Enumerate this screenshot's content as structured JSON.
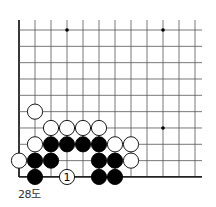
{
  "caption": "28도",
  "board": {
    "origin_x": 19,
    "origin_y": 30,
    "spacing_x": 16,
    "spacing_y": 16.33,
    "cols": 12,
    "rows": 10,
    "right_extend": 202,
    "top_extend": 20,
    "stone_radius": 7.6,
    "edges": [
      "left",
      "bottom"
    ],
    "line_color": "#555555",
    "edge_color": "#222222",
    "black_color": "#000000",
    "white_fill": "#ffffff",
    "star_points": [
      [
        3,
        0
      ],
      [
        9,
        0
      ],
      [
        9,
        6
      ]
    ],
    "stones": [
      {
        "color": "white",
        "col": 1,
        "row": 5
      },
      {
        "color": "white",
        "col": 2,
        "row": 6
      },
      {
        "color": "white",
        "col": 3,
        "row": 6
      },
      {
        "color": "white",
        "col": 4,
        "row": 6
      },
      {
        "color": "white",
        "col": 5,
        "row": 6
      },
      {
        "color": "white",
        "col": 1,
        "row": 7
      },
      {
        "color": "black",
        "col": 2,
        "row": 7
      },
      {
        "color": "black",
        "col": 3,
        "row": 7
      },
      {
        "color": "black",
        "col": 4,
        "row": 7
      },
      {
        "color": "black",
        "col": 5,
        "row": 7
      },
      {
        "color": "white",
        "col": 6,
        "row": 7
      },
      {
        "color": "white",
        "col": 7,
        "row": 7
      },
      {
        "color": "white",
        "col": 0,
        "row": 8
      },
      {
        "color": "black",
        "col": 1,
        "row": 8
      },
      {
        "color": "black",
        "col": 2,
        "row": 8
      },
      {
        "color": "black",
        "col": 5,
        "row": 8
      },
      {
        "color": "black",
        "col": 6,
        "row": 8
      },
      {
        "color": "white",
        "col": 7,
        "row": 8
      },
      {
        "color": "black",
        "col": 1,
        "row": 9
      },
      {
        "color": "white",
        "col": 3,
        "row": 9,
        "label": "1"
      },
      {
        "color": "black",
        "col": 5,
        "row": 9
      },
      {
        "color": "black",
        "col": 6,
        "row": 9
      }
    ]
  }
}
